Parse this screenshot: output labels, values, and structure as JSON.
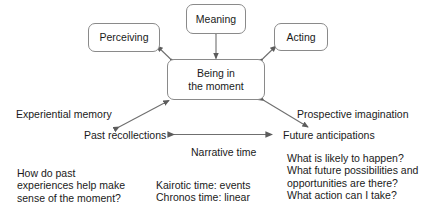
{
  "diagram": {
    "stroke_color": "#6f6f6f",
    "node_border_color": "#8a8a8a",
    "text_color": "#1a1a1a",
    "background_color": "#ffffff",
    "nodes": {
      "perceiving": "Perceiving",
      "meaning": "Meaning",
      "acting": "Acting",
      "center": "Being in\nthe moment"
    },
    "labels": {
      "experiential_memory": "Experiential memory",
      "prospective_imagination": "Prospective imagination",
      "past_recollections": "Past recollections",
      "future_anticipations": "Future anticipations",
      "narrative_time": "Narrative time"
    },
    "blocks": {
      "past_questions": "How do past\nexperiences help make\nsense of the moment?",
      "time_types": "Kairotic time: events\nChronos time: linear",
      "future_questions": "What is likely to happen?\nWhat future possibilities and\nopportunities are there?\nWhat action can I take?"
    }
  }
}
